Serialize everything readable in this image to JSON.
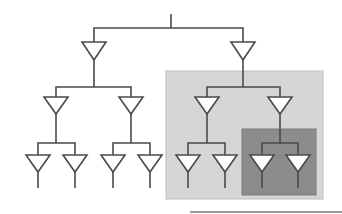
{
  "diagram": {
    "type": "binary-tree-of-amplifier-triangles",
    "levels": 4,
    "colors": {
      "line": "#4a4a4a",
      "triangle_fill": "#ffffff",
      "light_box": "#d6d6d6",
      "light_box_border": "#bdbdbd",
      "dark_box": "#8c8c8c",
      "dark_box_border": "#7a7a7a",
      "bottom_rule": "#9a9a9a"
    },
    "highlight_regions": [
      {
        "name": "subtree-level-1-right",
        "shade": "light"
      },
      {
        "name": "subtree-level-2-right-right",
        "shade": "dark"
      }
    ],
    "leaf_count": 8
  }
}
